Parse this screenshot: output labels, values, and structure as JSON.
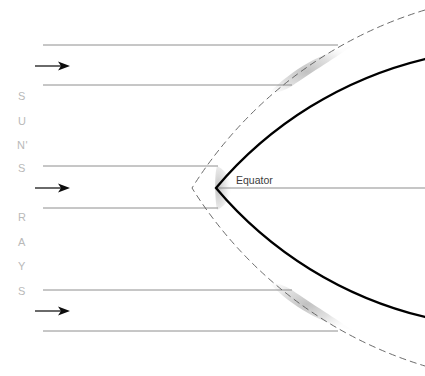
{
  "diagram": {
    "background_color": "#ffffff",
    "width": 425,
    "height": 376,
    "vertical_label": {
      "name": "suns-rays-label",
      "full_text": "SUN'S RAYS",
      "color": "#b9b9b9",
      "letters": [
        {
          "char": "S",
          "x": 18,
          "y": 100
        },
        {
          "char": "U",
          "x": 18,
          "y": 125
        },
        {
          "char": "N'",
          "x": 17,
          "y": 149
        },
        {
          "char": "S",
          "x": 18,
          "y": 172
        },
        {
          "char": "R",
          "x": 18,
          "y": 221
        },
        {
          "char": "A",
          "x": 18,
          "y": 246
        },
        {
          "char": "Y",
          "x": 18,
          "y": 270
        },
        {
          "char": "S",
          "x": 18,
          "y": 295
        }
      ]
    },
    "equator": {
      "name": "equator-label",
      "label": "Equator",
      "label_x": 236,
      "label_y": 184,
      "line_y": 188,
      "line_x1": 216,
      "line_x2": 425,
      "color": "#8e8e8e"
    },
    "rays": {
      "color": "#8e8e8e",
      "lines": [
        {
          "y": 45,
          "x1": 43,
          "x2": 338
        },
        {
          "y": 85,
          "x1": 43,
          "x2": 292
        },
        {
          "y": 166,
          "x1": 43,
          "x2": 218
        },
        {
          "y": 208,
          "x1": 43,
          "x2": 218
        },
        {
          "y": 290,
          "x1": 43,
          "x2": 292
        },
        {
          "y": 331,
          "x1": 43,
          "x2": 338
        }
      ],
      "arrows": [
        {
          "y": 66,
          "x1": 35,
          "x2": 68
        },
        {
          "y": 188,
          "x1": 35,
          "x2": 68
        },
        {
          "y": 311,
          "x1": 35,
          "x2": 68
        }
      ]
    },
    "earth": {
      "name": "earth-surface-arc",
      "color": "#000000",
      "stroke_width": 2.3,
      "center_x": 610,
      "center_y": 188,
      "radius": 394,
      "vertex_x": 216
    },
    "atmosphere": {
      "name": "atmosphere-boundary-arc",
      "color": "#5b5b5b",
      "stroke_width": 0.9,
      "dash": "7 4",
      "center_x": 610,
      "center_y": 188,
      "radius": 418,
      "vertex_x": 192
    },
    "shaded_regions": [
      {
        "name": "atmospheric-path-shading-north",
        "color": "#b5b5b5",
        "opacity": 0.55,
        "position": "north"
      },
      {
        "name": "atmospheric-path-shading-equator",
        "color": "#b5b5b5",
        "opacity": 0.5,
        "position": "equator"
      },
      {
        "name": "atmospheric-path-shading-south",
        "color": "#b5b5b5",
        "opacity": 0.55,
        "position": "south"
      }
    ]
  }
}
